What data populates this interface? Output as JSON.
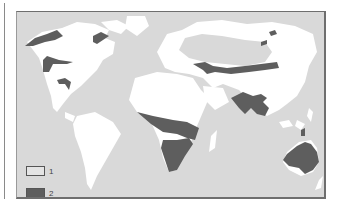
{
  "map": {
    "title": "",
    "colors": {
      "sea": "#d9d9d9",
      "land": "#ffffff",
      "category_1": "#d9d9d9",
      "category_2": "#5e5e5e",
      "frame": "#6e6e6e"
    },
    "legend": [
      {
        "key": "1",
        "label": "1",
        "fill": "#e4e4e4"
      },
      {
        "key": "2",
        "label": "2",
        "fill": "#5e5e5e"
      }
    ],
    "regions_category_2": [
      "Alaska / NW Canada",
      "Hudson Bay east coast",
      "Great Plains (North America)",
      "Mexico / Central America highlands",
      "Central Asian steppe belt",
      "NE Siberia islets",
      "Sahel and East Africa",
      "Southern Africa",
      "South / Southeast Asia (India–Indochina)",
      "Australia"
    ],
    "regions_category_1": [
      "Northern Eurasia (Siberia)"
    ]
  }
}
